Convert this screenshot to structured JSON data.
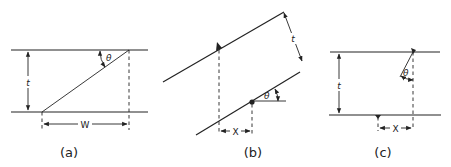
{
  "figure": {
    "panels": [
      {
        "id": "a",
        "caption": "(a)",
        "labels": {
          "thickness": "t",
          "width": "W",
          "angle": "θ"
        }
      },
      {
        "id": "b",
        "caption": "(b)",
        "labels": {
          "thickness": "t",
          "offset": "X",
          "angle": "θ"
        }
      },
      {
        "id": "c",
        "caption": "(c)",
        "labels": {
          "thickness": "t",
          "offset": "X",
          "angle": "θ"
        }
      }
    ],
    "colors": {
      "line": "#222222",
      "background": "#ffffff"
    }
  }
}
